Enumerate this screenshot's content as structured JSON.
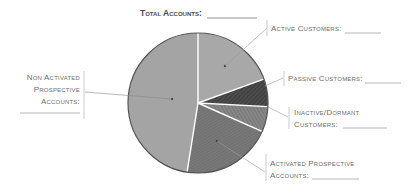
{
  "chart_data": {
    "type": "pie",
    "title": "Total Accounts:",
    "title_blank": "__________",
    "note": "Fill-in worksheet pie chart; no numeric values shown. Slice sizes estimated from angles (degrees).",
    "start_angle_deg": 0,
    "direction": "clockwise",
    "slices": [
      {
        "name": "Active Customers",
        "label_lines": [
          "Active Customers:"
        ],
        "degrees": 70,
        "percent_est": 19.4,
        "color": "#a8a8a8",
        "pattern": "speckle"
      },
      {
        "name": "Passive Customers",
        "label_lines": [
          "Passive Customers:"
        ],
        "degrees": 23,
        "percent_est": 6.4,
        "color": "#4c4c4c",
        "pattern": "hatch"
      },
      {
        "name": "Inactive/Dormant Customers",
        "label_lines": [
          "Inactive/Dormant",
          "Customers:"
        ],
        "degrees": 21,
        "percent_est": 5.8,
        "color": "#848484",
        "pattern": "hatch"
      },
      {
        "name": "Activated Prospective Accounts",
        "label_lines": [
          "Activated Prospective",
          "Accounts:"
        ],
        "degrees": 75,
        "percent_est": 20.8,
        "color": "#767676",
        "pattern": "hatch"
      },
      {
        "name": "Non Activated Prospective Accounts",
        "label_lines": [
          "Non Activated",
          "Prospective",
          "Accounts:"
        ],
        "degrees": 171,
        "percent_est": 47.5,
        "color": "#a4a4a4",
        "pattern": "speckle"
      }
    ],
    "legend": "none (leader-line labels)",
    "colors": {
      "outline": "#555555",
      "separator": "#ffffff",
      "leader": "#9a9a9a",
      "text": "#6e6e6e"
    }
  },
  "labels": {
    "title": "Total Accounts:",
    "active": [
      "Active Customers:"
    ],
    "passive": [
      "Passive Customers:"
    ],
    "inactive": [
      "Inactive/Dormant",
      "Customers:"
    ],
    "activated": [
      "Activated Prospective",
      "Accounts:"
    ],
    "nonactivated": [
      "Non Activated",
      "Prospective",
      "Accounts:"
    ]
  }
}
